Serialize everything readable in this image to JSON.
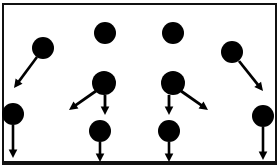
{
  "figure": {
    "title": "",
    "background_color": "#ffffff",
    "ink_color": "#000000",
    "width": 280,
    "height": 168
  },
  "frame": {
    "name": "outer-border",
    "x": 3,
    "y": 4,
    "width": 273,
    "height": 159,
    "stroke_color": "#111111",
    "stroke_width": 2,
    "bottom_stroke_width": 4,
    "fill": "#ffffff"
  },
  "chart_data": {
    "type": "scatter",
    "title": "",
    "xlabel": "",
    "ylabel": "",
    "xlim": [
      0,
      280
    ],
    "ylim": [
      0,
      168
    ],
    "grid": false,
    "legend": "none",
    "node_color": "#000000",
    "arrow_color": "#000000",
    "nodes": [
      {
        "id": "n1",
        "label": "",
        "x": 43,
        "y": 48,
        "r": 11
      },
      {
        "id": "n2",
        "label": "",
        "x": 13,
        "y": 114,
        "r": 11
      },
      {
        "id": "n3",
        "label": "",
        "x": 105,
        "y": 33,
        "r": 11
      },
      {
        "id": "n4",
        "label": "",
        "x": 104,
        "y": 83,
        "r": 12
      },
      {
        "id": "n5",
        "label": "",
        "x": 100,
        "y": 131,
        "r": 11
      },
      {
        "id": "n6",
        "label": "",
        "x": 173,
        "y": 33,
        "r": 11
      },
      {
        "id": "n7",
        "label": "",
        "x": 173,
        "y": 83,
        "r": 12
      },
      {
        "id": "n8",
        "label": "",
        "x": 169,
        "y": 131,
        "r": 11
      },
      {
        "id": "n9",
        "label": "",
        "x": 232,
        "y": 52,
        "r": 11
      },
      {
        "id": "n10",
        "label": "",
        "x": 263,
        "y": 116,
        "r": 11
      }
    ],
    "arrows": [
      {
        "id": "a1",
        "from": "n1",
        "x1": 37,
        "y1": 57,
        "x2": 14,
        "y2": 88,
        "width": 2.6
      },
      {
        "id": "a2",
        "from": "n2",
        "x1": 13,
        "y1": 125,
        "x2": 13,
        "y2": 158,
        "width": 2.6
      },
      {
        "id": "a3",
        "from": "n4",
        "x1": 96,
        "y1": 91,
        "x2": 69,
        "y2": 110,
        "width": 2.8
      },
      {
        "id": "a4",
        "from": "n4",
        "x1": 105,
        "y1": 95,
        "x2": 105,
        "y2": 115,
        "width": 2.8
      },
      {
        "id": "a5",
        "from": "n5",
        "x1": 100,
        "y1": 142,
        "x2": 100,
        "y2": 162,
        "width": 2.6
      },
      {
        "id": "a6",
        "from": "n7",
        "x1": 169,
        "y1": 95,
        "x2": 169,
        "y2": 115,
        "width": 2.8
      },
      {
        "id": "a7",
        "from": "n7",
        "x1": 181,
        "y1": 91,
        "x2": 208,
        "y2": 110,
        "width": 2.8
      },
      {
        "id": "a8",
        "from": "n8",
        "x1": 169,
        "y1": 142,
        "x2": 169,
        "y2": 162,
        "width": 2.6
      },
      {
        "id": "a9",
        "from": "n9",
        "x1": 239,
        "y1": 61,
        "x2": 263,
        "y2": 91,
        "width": 2.8
      },
      {
        "id": "a10",
        "from": "n10",
        "x1": 263,
        "y1": 127,
        "x2": 263,
        "y2": 160,
        "width": 2.6
      }
    ]
  }
}
